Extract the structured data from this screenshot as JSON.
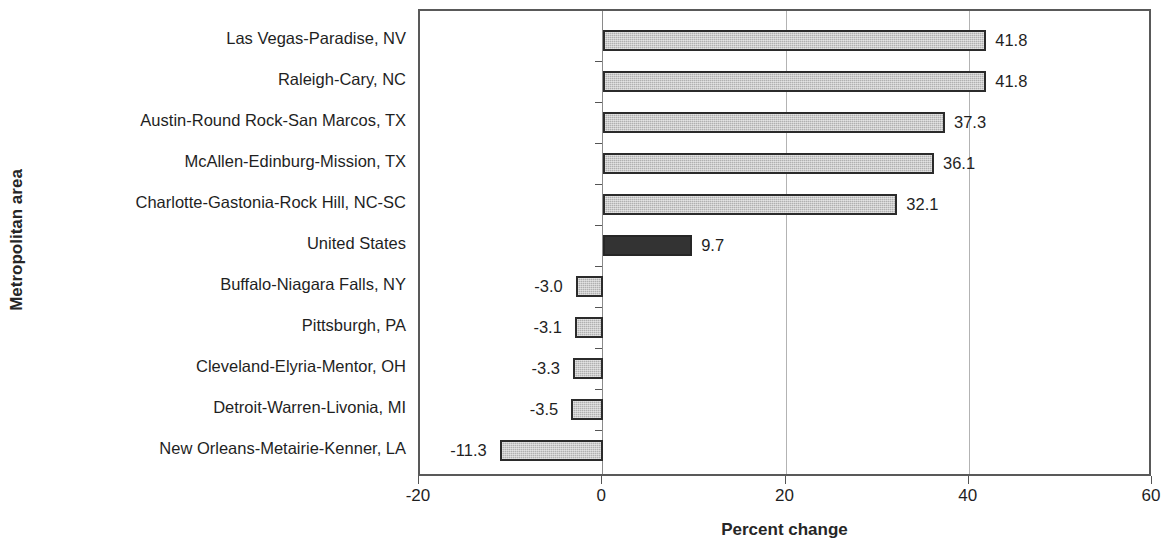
{
  "chart_data": {
    "type": "bar",
    "orientation": "horizontal",
    "title": "",
    "xlabel": "Percent change",
    "ylabel": "Metropolitan area",
    "xlim": [
      -20,
      60
    ],
    "xticks": [
      "-20",
      "0",
      "20",
      "40",
      "60"
    ],
    "xtick_values": [
      -20,
      0,
      20,
      40,
      60
    ],
    "grid": "vertical gridlines at 20 and 40",
    "legend": "none",
    "categories": [
      "Las Vegas-Paradise, NV",
      "Raleigh-Cary, NC",
      "Austin-Round Rock-San Marcos, TX",
      "McAllen-Edinburg-Mission, TX",
      "Charlotte-Gastonia-Rock Hill, NC-SC",
      "United States",
      "Buffalo-Niagara Falls, NY",
      "Pittsburgh, PA",
      "Cleveland-Elyria-Mentor, OH",
      "Detroit-Warren-Livonia, MI",
      "New Orleans-Metairie-Kenner, LA"
    ],
    "values": [
      41.8,
      41.8,
      37.3,
      36.1,
      32.1,
      9.7,
      -3.0,
      -3.1,
      -3.3,
      -3.5,
      -11.3
    ],
    "value_labels": [
      "41.8",
      "41.8",
      "37.3",
      "36.1",
      "32.1",
      "9.7",
      "-3.0",
      "-3.1",
      "-3.3",
      "-3.5",
      "-11.3"
    ],
    "bar_styles": [
      "light",
      "light",
      "light",
      "light",
      "light",
      "dark",
      "light",
      "light",
      "light",
      "light",
      "light"
    ],
    "colors": {
      "bar_light_fill": "#b0b0b0",
      "bar_dark_fill": "#333333",
      "bar_border": "#2b2b2b",
      "gridline": "#b3b3b3",
      "axis": "#595959",
      "text": "#1f1f1f",
      "background": "#ffffff"
    }
  }
}
